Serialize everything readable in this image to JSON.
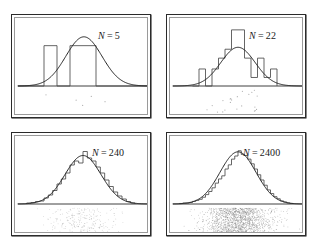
{
  "figure": {
    "kind": "statistics-illustration",
    "background_color": "#ffffff",
    "frame_color": "#2b2b2b",
    "curve_color": "#242424",
    "histogram_color": "#4a4a4a",
    "dot_color": "#6e6e6e"
  },
  "chart_data": [
    {
      "type": "bar",
      "panel_index": 0,
      "title": "N = 5",
      "label_prefix": "N",
      "label_equals": "=",
      "label_value": "5",
      "sample_size": 5,
      "xlabel": "",
      "ylabel": "",
      "grid": false,
      "legend": "none",
      "xlim": [
        -3.6,
        3.6
      ],
      "ylim": [
        0,
        1.22
      ],
      "bin_width": 0.72,
      "categories": [
        "-3.24",
        "-2.52",
        "-1.80",
        "-1.08",
        "-0.36",
        "0.36",
        "1.08",
        "1.80",
        "2.52",
        "3.24"
      ],
      "values": [
        0,
        0,
        0.82,
        0,
        0.82,
        0.82,
        0,
        0,
        0,
        0
      ],
      "bin_edges": [
        -3.6,
        -2.88,
        -2.16,
        -1.44,
        -0.72,
        0,
        0.72,
        1.44,
        2.16,
        2.88,
        3.6
      ],
      "bin_counts": [
        0,
        0,
        1,
        0,
        1,
        1,
        0,
        0,
        0,
        0
      ],
      "curve": {
        "name": "gaussian",
        "mean": 0.05,
        "sigma": 1.0,
        "peak_height": 1.0
      },
      "rug_points": [
        -2.05,
        -0.38,
        -0.02,
        0.46,
        1.22
      ],
      "rug_scatter_count": 5
    },
    {
      "type": "bar",
      "panel_index": 1,
      "title": "N = 22",
      "label_prefix": "N",
      "label_equals": "=",
      "label_value": "22",
      "sample_size": 22,
      "xlabel": "",
      "ylabel": "",
      "grid": false,
      "legend": "none",
      "xlim": [
        -3.6,
        3.6
      ],
      "ylim": [
        0,
        1.55
      ],
      "bin_width": 0.36,
      "categories": [
        "-2.34",
        "-1.98",
        "-1.62",
        "-1.26",
        "-0.90",
        "-0.54",
        "-0.18",
        "0.18",
        "0.54",
        "0.90",
        "1.26",
        "1.62",
        "1.98"
      ],
      "values": [
        0,
        0.44,
        0,
        0.44,
        0.72,
        0.95,
        1.45,
        1.45,
        0.72,
        0.22,
        0.72,
        0.22,
        0.44
      ],
      "bin_edges": [
        -2.52,
        -2.16,
        -1.8,
        -1.44,
        -1.08,
        -0.72,
        -0.36,
        0,
        0.36,
        0.72,
        1.08,
        1.44,
        1.8,
        2.16
      ],
      "bin_counts": [
        0,
        1,
        0,
        1,
        2,
        3,
        5,
        5,
        2,
        1,
        2,
        1,
        1
      ],
      "curve": {
        "name": "gaussian",
        "mean": 0.0,
        "sigma": 0.95,
        "peak_height": 1.0
      },
      "rug_scatter_count": 22
    },
    {
      "type": "bar",
      "panel_index": 2,
      "title": "N = 240",
      "label_prefix": "N",
      "label_equals": "=",
      "label_value": "240",
      "sample_size": 240,
      "xlabel": "",
      "ylabel": "",
      "grid": false,
      "legend": "none",
      "xlim": [
        -3.6,
        3.6
      ],
      "ylim": [
        0,
        1.2
      ],
      "bin_width": 0.24,
      "categories": [
        "-3.0",
        "-2.76",
        "-2.52",
        "-2.28",
        "-2.04",
        "-1.8",
        "-1.56",
        "-1.32",
        "-1.08",
        "-0.84",
        "-0.6",
        "-0.36",
        "-0.12",
        "0.12",
        "0.36",
        "0.6",
        "0.84",
        "1.08",
        "1.32",
        "1.56",
        "1.8",
        "2.04",
        "2.28",
        "2.52",
        "2.76"
      ],
      "values": [
        0.02,
        0.03,
        0.05,
        0.06,
        0.12,
        0.18,
        0.27,
        0.4,
        0.5,
        0.62,
        0.78,
        0.86,
        0.82,
        1.05,
        0.92,
        0.86,
        0.74,
        0.62,
        0.48,
        0.35,
        0.24,
        0.16,
        0.1,
        0.05,
        0.02
      ],
      "curve": {
        "name": "gaussian",
        "mean": 0.0,
        "sigma": 1.0,
        "peak_height": 0.97
      },
      "rug_scatter_count": 240
    },
    {
      "type": "bar",
      "panel_index": 3,
      "title": "N = 2400",
      "label_prefix": "N",
      "label_equals": "=",
      "label_value": "2400",
      "sample_size": 2400,
      "xlabel": "",
      "ylabel": "",
      "grid": false,
      "legend": "none",
      "xlim": [
        -3.6,
        3.6
      ],
      "ylim": [
        0,
        1.15
      ],
      "bin_width": 0.18,
      "categories": [
        "-3.15",
        "-2.97",
        "-2.79",
        "-2.61",
        "-2.43",
        "-2.25",
        "-2.07",
        "-1.89",
        "-1.71",
        "-1.53",
        "-1.35",
        "-1.17",
        "-0.99",
        "-0.81",
        "-0.63",
        "-0.45",
        "-0.27",
        "-0.09",
        "0.09",
        "0.27",
        "0.45",
        "0.63",
        "0.81",
        "0.99",
        "1.17",
        "1.35",
        "1.53",
        "1.71",
        "1.89",
        "2.07",
        "2.25",
        "2.43",
        "2.61",
        "2.79",
        "2.97"
      ],
      "values": [
        0.01,
        0.02,
        0.02,
        0.03,
        0.05,
        0.07,
        0.09,
        0.13,
        0.18,
        0.24,
        0.31,
        0.4,
        0.48,
        0.54,
        0.67,
        0.75,
        0.86,
        0.92,
        1.02,
        0.95,
        0.93,
        0.86,
        0.77,
        0.67,
        0.56,
        0.46,
        0.36,
        0.27,
        0.2,
        0.14,
        0.1,
        0.06,
        0.04,
        0.02,
        0.01
      ],
      "curve": {
        "name": "gaussian",
        "mean": 0.0,
        "sigma": 1.0,
        "peak_height": 1.0
      },
      "rug_scatter_count": 2400
    }
  ]
}
